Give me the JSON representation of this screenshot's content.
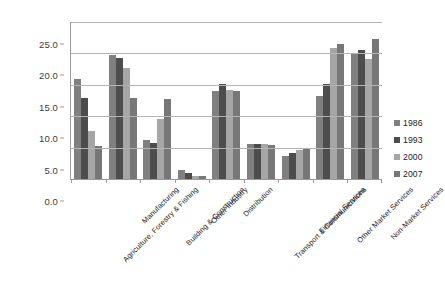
{
  "chart_data": {
    "type": "bar",
    "title": "",
    "subtitle": "",
    "xlabel": "",
    "ylabel": "",
    "ylim": [
      0,
      25
    ],
    "ytick_labels": [
      "0.0",
      "5.0",
      "10.0",
      "15.0",
      "20.0",
      "25.0"
    ],
    "ytick_values": [
      0,
      5,
      10,
      15,
      20,
      25
    ],
    "grid": true,
    "legend_position": "right",
    "orientation": "vertical",
    "categories": [
      "Agriculture, Forestry & Fishing",
      "Manufacturing",
      "Building & Construction",
      "Other Industry",
      "Distribution",
      "Transport & Communications",
      "Financial Services",
      "Other Market Services",
      "Non-Market Services"
    ],
    "series": [
      {
        "name": "1986",
        "color": "#808080",
        "values": [
          15.9,
          19.8,
          6.2,
          1.4,
          14.0,
          5.6,
          3.6,
          13.2,
          20.0
        ]
      },
      {
        "name": "1993",
        "color": "#4d4d4d",
        "values": [
          12.9,
          19.3,
          5.8,
          1.0,
          15.1,
          5.6,
          4.1,
          15.1,
          20.6
        ]
      },
      {
        "name": "2000",
        "color": "#a6a6a6",
        "values": [
          7.7,
          17.6,
          9.5,
          0.5,
          14.1,
          5.6,
          4.6,
          20.8,
          19.1
        ]
      },
      {
        "name": "2007",
        "color": "#777777",
        "values": [
          5.2,
          12.9,
          12.7,
          0.5,
          14.0,
          5.4,
          4.8,
          21.5,
          22.3
        ]
      }
    ]
  },
  "legend": {
    "entries": [
      {
        "label": "1986",
        "color": "#808080"
      },
      {
        "label": "1993",
        "color": "#4d4d4d"
      },
      {
        "label": "2000",
        "color": "#a6a6a6"
      },
      {
        "label": "2007",
        "color": "#777777"
      }
    ]
  },
  "axes": {
    "grid_color": "#b4b4b4",
    "axis_color": "#9a9a9a"
  }
}
